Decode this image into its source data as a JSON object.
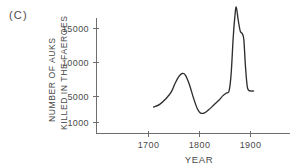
{
  "panel": {
    "label": "(C)"
  },
  "chart_data": {
    "type": "line",
    "title": "",
    "panel_label": "(C)",
    "xlabel": "YEAR",
    "ylabel": "NUMBER OF AUKS KILLED IN THE FAEROES",
    "ylabel_line1": "NUMBER OF AUKS",
    "ylabel_line2": "KILLED IN THE FAEROES",
    "xlim": [
      1660,
      1930
    ],
    "ylim": [
      1000,
      18500
    ],
    "xticks": [
      1700,
      1800,
      1900
    ],
    "xtick_labels": [
      "1700",
      "1800",
      "1900"
    ],
    "yticks": [
      1000,
      5000,
      10000,
      15000
    ],
    "ytick_labels": [
      "1000",
      "5000",
      "10000",
      "15000"
    ],
    "grid": false,
    "legend": false,
    "series": [
      {
        "name": "Auks killed in the Faeroes",
        "color": "#2e2e2e",
        "x": [
          1710,
          1722,
          1735,
          1745,
          1752,
          1760,
          1766,
          1772,
          1780,
          1788,
          1796,
          1802,
          1810,
          1818,
          1828,
          1838,
          1846,
          1853,
          1858,
          1862,
          1866,
          1869,
          1872,
          1876,
          1880,
          1884,
          1887,
          1890,
          1894,
          1900,
          1906
        ],
        "y": [
          3300,
          3700,
          4600,
          5600,
          6800,
          7900,
          8300,
          8100,
          6700,
          4700,
          3000,
          2400,
          2450,
          2900,
          3600,
          4300,
          5000,
          5400,
          5700,
          8200,
          13500,
          16500,
          18200,
          16200,
          14600,
          14200,
          13300,
          9500,
          6200,
          5700,
          5700
        ]
      }
    ]
  }
}
